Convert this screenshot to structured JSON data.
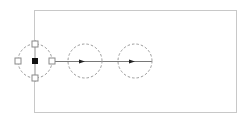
{
  "canvas": {
    "width": 251,
    "height": 122,
    "background": "#ffffff"
  },
  "frame": {
    "x": 34,
    "y": 10,
    "width": 202,
    "height": 102,
    "stroke": "#c8c8c8"
  },
  "connector": {
    "y": 61,
    "x1": 50,
    "x2": 152,
    "stroke": "#555555"
  },
  "nodes": [
    {
      "id": "node-1",
      "cx": 35,
      "cy": 61,
      "r": 17,
      "selected": true
    },
    {
      "id": "node-2",
      "cx": 85,
      "cy": 61,
      "r": 17,
      "selected": false
    },
    {
      "id": "node-3",
      "cx": 135,
      "cy": 61,
      "r": 17,
      "selected": false
    }
  ],
  "colors": {
    "circle_stroke": "#9a9a9a",
    "handle_stroke": "#8a8a8a",
    "anchor_fill": "#111111",
    "arrow": "#222222"
  }
}
